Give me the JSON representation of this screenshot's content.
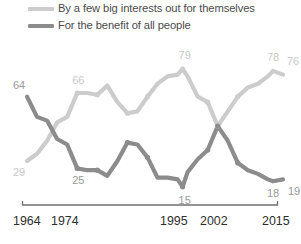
{
  "legend": {
    "position": "top-left",
    "entries": [
      {
        "label": "By a few big interests out for themselves",
        "color": "#cccccc",
        "icon": "line-swatch"
      },
      {
        "label": "For the benefit of all people",
        "color": "#8c8c8c",
        "icon": "line-swatch"
      }
    ]
  },
  "axis": {
    "ticks": [
      "1964",
      "1974",
      "1995",
      "2002",
      "2015"
    ],
    "line_color": "#6f6f6f"
  },
  "chart_data": {
    "type": "line",
    "title": "",
    "subtitle": "",
    "xlabel": "",
    "ylabel": "",
    "grid": false,
    "legend_position": "top-left",
    "xlim": [
      1964,
      2015
    ],
    "ylim": [
      0,
      100
    ],
    "x_tick_labels": [
      "1964",
      "1974",
      "1995",
      "2002",
      "2015"
    ],
    "annotations": [
      {
        "text": "64",
        "series": "For the benefit of all people",
        "x": 1964,
        "value": 64
      },
      {
        "text": "29",
        "series": "By a few big interests out for themselves",
        "x": 1964,
        "value": 29
      },
      {
        "text": "66",
        "series": "By a few big interests out for themselves",
        "x": 1974,
        "value": 66
      },
      {
        "text": "25",
        "series": "For the benefit of all people",
        "x": 1974,
        "value": 25
      },
      {
        "text": "79",
        "series": "By a few big interests out for themselves",
        "x": 1995,
        "value": 79
      },
      {
        "text": "15",
        "series": "For the benefit of all people",
        "x": 1995,
        "value": 15
      },
      {
        "text": "78",
        "series": "By a few big interests out for themselves",
        "x": 2013,
        "value": 78
      },
      {
        "text": "76",
        "series": "By a few big interests out for themselves",
        "x": 2015,
        "value": 76
      },
      {
        "text": "18",
        "series": "For the benefit of all people",
        "x": 2013,
        "value": 18
      },
      {
        "text": "19",
        "series": "For the benefit of all people",
        "x": 2015,
        "value": 19
      }
    ],
    "series": [
      {
        "name": "By a few big interests out for themselves",
        "color": "#cccccc",
        "x": [
          1964,
          1966,
          1968,
          1970,
          1972,
          1974,
          1976,
          1978,
          1980,
          1982,
          1984,
          1986,
          1988,
          1990,
          1992,
          1994,
          1995,
          1996,
          1998,
          2000,
          2002,
          2004,
          2006,
          2008,
          2010,
          2012,
          2013,
          2015
        ],
        "values": [
          29,
          33,
          40,
          50,
          53,
          66,
          66,
          65,
          70,
          61,
          55,
          56,
          64,
          71,
          75,
          76,
          79,
          75,
          64,
          61,
          48,
          56,
          64,
          69,
          71,
          75,
          78,
          76
        ]
      },
      {
        "name": "For the benefit of all people",
        "color": "#8c8c8c",
        "x": [
          1964,
          1966,
          1968,
          1970,
          1972,
          1974,
          1976,
          1978,
          1980,
          1982,
          1984,
          1986,
          1988,
          1990,
          1992,
          1994,
          1995,
          1996,
          1998,
          2000,
          2002,
          2004,
          2006,
          2008,
          2010,
          2012,
          2013,
          2015
        ],
        "values": [
          64,
          53,
          51,
          41,
          38,
          25,
          24,
          24,
          21,
          29,
          39,
          38,
          31,
          20,
          20,
          19,
          15,
          23,
          30,
          35,
          48,
          40,
          28,
          24,
          22,
          19,
          18,
          19
        ]
      }
    ]
  }
}
